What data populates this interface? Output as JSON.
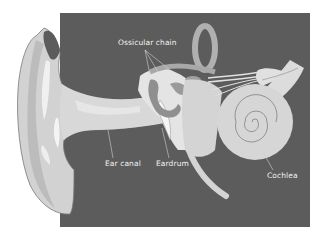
{
  "diagram": {
    "colors": {
      "background": "#ffffff",
      "panel": "#5c5c5c",
      "tissue_light": "#d6d6d6",
      "tissue_mid": "#bdbdbd",
      "tissue_dark": "#8f8f8f",
      "highlight": "#f4f4f4",
      "label_text": "#f2f2f2",
      "leader_line": "#d0d0d0"
    },
    "labels": [
      {
        "id": "ossicular-chain",
        "text": "Ossicular chain"
      },
      {
        "id": "ear-canal",
        "text": "Ear canal"
      },
      {
        "id": "eardrum",
        "text": "Eardrum"
      },
      {
        "id": "cochlea",
        "text": "Cochlea"
      }
    ]
  }
}
